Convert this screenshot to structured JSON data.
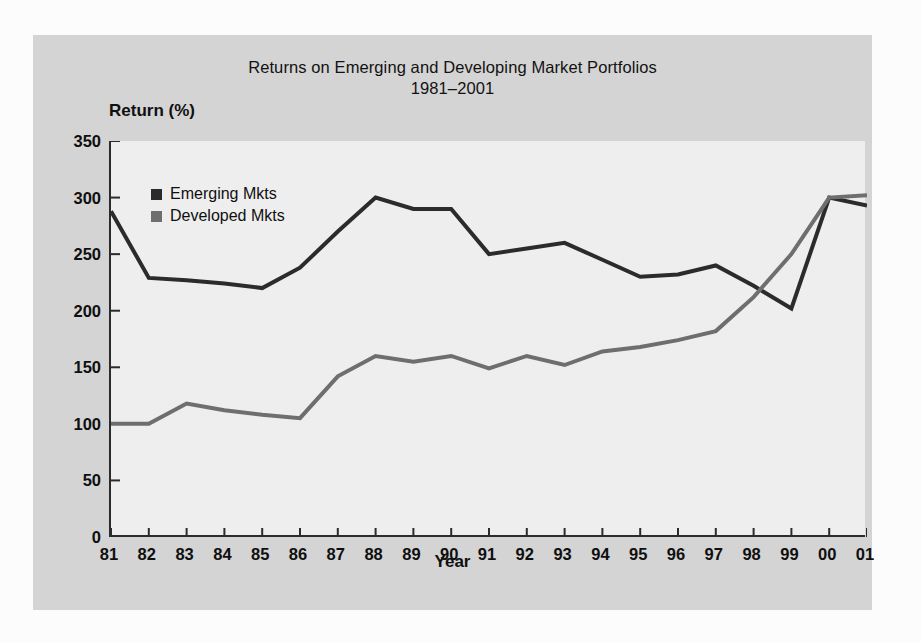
{
  "chart_data": {
    "type": "line",
    "title": "Returns on Emerging and Developing Market Portfolios",
    "subtitle": "1981–2001",
    "xlabel": "Year",
    "ylabel": "Return (%)",
    "ylim": [
      0,
      350
    ],
    "yticks": [
      0,
      50,
      100,
      150,
      200,
      250,
      300,
      350
    ],
    "grid": false,
    "legend_position": "top-left",
    "categories": [
      "81",
      "82",
      "83",
      "84",
      "85",
      "86",
      "87",
      "88",
      "89",
      "90",
      "91",
      "92",
      "93",
      "94",
      "95",
      "96",
      "97",
      "98",
      "99",
      "00",
      "01"
    ],
    "series": [
      {
        "name": "Emerging Mkts",
        "color": "#2b2b2b",
        "values": [
          288,
          229,
          227,
          224,
          220,
          238,
          270,
          300,
          290,
          290,
          250,
          255,
          260,
          245,
          230,
          232,
          240,
          222,
          202,
          300,
          293
        ]
      },
      {
        "name": "Developed Mkts",
        "color": "#6e6e6e",
        "values": [
          100,
          100,
          118,
          112,
          108,
          105,
          142,
          160,
          155,
          160,
          149,
          160,
          152,
          164,
          168,
          174,
          182,
          212,
          250,
          300,
          302
        ]
      }
    ]
  },
  "legend": {
    "items": [
      {
        "label": "Emerging Mkts",
        "color": "#2b2b2b"
      },
      {
        "label": "Developed Mkts",
        "color": "#6e6e6e"
      }
    ]
  },
  "colors": {
    "page_background": "#fcfcfc",
    "panel_background": "#d4d4d4",
    "plot_background": "#eeeeee",
    "axis": "#2b2b2b",
    "emerging_line": "#2b2b2b",
    "developed_line": "#6e6e6e"
  }
}
